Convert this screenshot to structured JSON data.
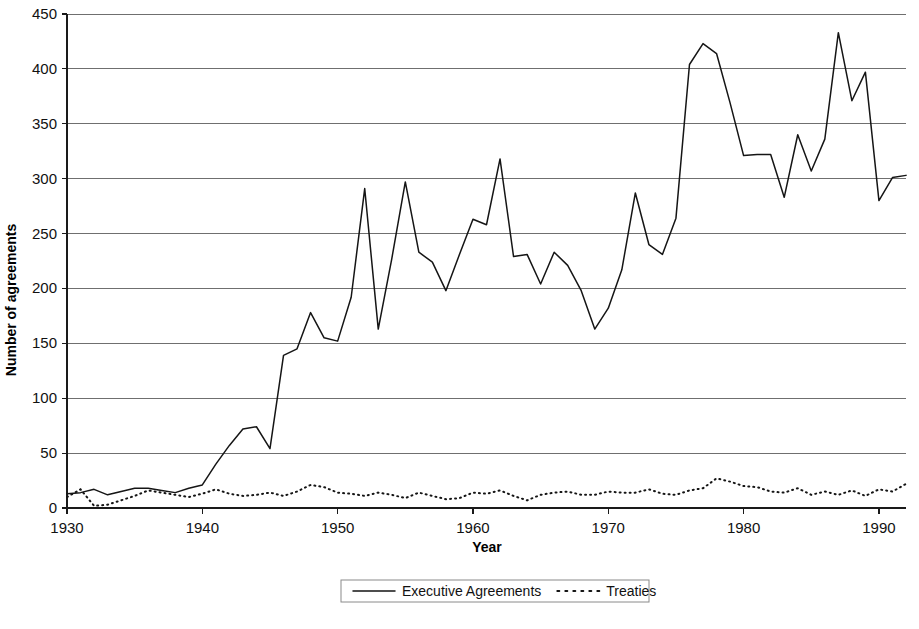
{
  "chart_data": {
    "type": "line",
    "title": "",
    "xlabel": "Year",
    "ylabel": "Number of agreements",
    "xlim": [
      1930,
      1992
    ],
    "ylim": [
      0,
      450
    ],
    "grid": true,
    "legend_position": "bottom",
    "x_ticks": [
      1930,
      1940,
      1950,
      1960,
      1970,
      1980,
      1990
    ],
    "x_tick_labels": [
      "1930",
      "1940",
      "1950",
      "1960",
      "1970",
      "1980",
      "1990"
    ],
    "y_ticks": [
      0,
      50,
      100,
      150,
      200,
      250,
      300,
      350,
      400,
      450
    ],
    "y_tick_labels": [
      "0",
      "50",
      "100",
      "150",
      "200",
      "250",
      "300",
      "350",
      "400",
      "450"
    ],
    "x": [
      1930,
      1931,
      1932,
      1933,
      1934,
      1935,
      1936,
      1937,
      1938,
      1939,
      1940,
      1941,
      1942,
      1943,
      1944,
      1945,
      1946,
      1947,
      1948,
      1949,
      1950,
      1951,
      1952,
      1953,
      1954,
      1955,
      1956,
      1957,
      1958,
      1959,
      1960,
      1961,
      1962,
      1963,
      1964,
      1965,
      1966,
      1967,
      1968,
      1969,
      1970,
      1971,
      1972,
      1973,
      1974,
      1975,
      1976,
      1977,
      1978,
      1979,
      1980,
      1981,
      1982,
      1983,
      1984,
      1985,
      1986,
      1987,
      1988,
      1989,
      1990,
      1991,
      1992
    ],
    "series": [
      {
        "name": "Executive Agreements",
        "style": "solid",
        "values": [
          13,
          14,
          17,
          12,
          15,
          18,
          18,
          16,
          14,
          18,
          21,
          40,
          57,
          72,
          74,
          54,
          139,
          145,
          178,
          155,
          152,
          192,
          291,
          163,
          227,
          297,
          233,
          224,
          198,
          231,
          263,
          258,
          318,
          229,
          231,
          204,
          233,
          221,
          198,
          163,
          182,
          217,
          287,
          240,
          231,
          264,
          404,
          423,
          414,
          369,
          321,
          322,
          322,
          283,
          340,
          307,
          336,
          433,
          371,
          397,
          280,
          301,
          303
        ]
      },
      {
        "name": "Treaties",
        "style": "dotted",
        "values": [
          10,
          17,
          2,
          3,
          7,
          11,
          16,
          14,
          12,
          10,
          13,
          17,
          13,
          11,
          12,
          14,
          11,
          15,
          21,
          19,
          14,
          13,
          11,
          14,
          12,
          9,
          14,
          11,
          8,
          9,
          14,
          13,
          16,
          11,
          7,
          12,
          14,
          15,
          12,
          12,
          15,
          14,
          14,
          17,
          13,
          12,
          16,
          18,
          27,
          24,
          20,
          19,
          15,
          14,
          18,
          12,
          15,
          12,
          16,
          11,
          17,
          15,
          22
        ]
      }
    ]
  },
  "legend": {
    "entries": [
      {
        "label": "Executive Agreements",
        "style": "solid"
      },
      {
        "label": "Treaties",
        "style": "dotted"
      }
    ]
  }
}
